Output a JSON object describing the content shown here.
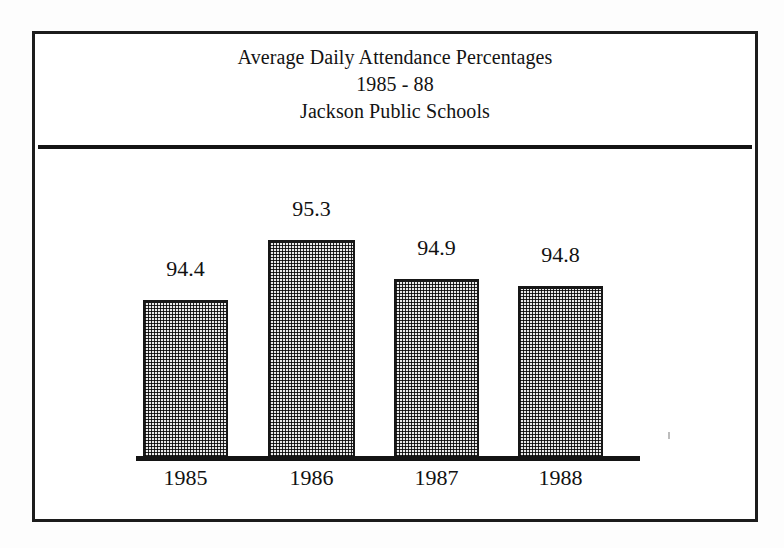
{
  "figure": {
    "title_lines": [
      "Average Daily Attendance Percentages",
      "1985 - 88",
      "Jackson Public Schools"
    ],
    "colors": {
      "ink": "#141414",
      "bar_fill": "#d8d8d8",
      "bar_outline": "#161616",
      "paper": "#ffffff"
    }
  },
  "chart_data": {
    "type": "bar",
    "title": "Average Daily Attendance Percentages 1985 - 88 Jackson Public Schools",
    "subtitle": "1985 - 88",
    "source_label": "Jackson Public Schools",
    "xlabel": "",
    "ylabel": "",
    "categories": [
      "1985",
      "1986",
      "1987",
      "1988"
    ],
    "values": [
      94.4,
      95.3,
      94.9,
      94.8
    ],
    "value_labels": [
      "94.4",
      "95.3",
      "94.9",
      "94.8"
    ],
    "ylim": [
      93.0,
      95.6
    ],
    "grid": false,
    "legend": false,
    "axis": {
      "y_axis_visible": false,
      "x_axis_visible": true,
      "tick_labels_visible": false
    },
    "bars": [
      {
        "category": "1985",
        "value": 94.4,
        "label": "94.4",
        "left": 143,
        "top": 300,
        "width": 85,
        "height": 158,
        "label_left": 143,
        "label_top": 258
      },
      {
        "category": "1986",
        "value": 95.3,
        "label": "95.3",
        "left": 268,
        "top": 240,
        "width": 87,
        "height": 218,
        "label_left": 268,
        "label_top": 198
      },
      {
        "category": "1987",
        "value": 94.9,
        "label": "94.9",
        "left": 394,
        "top": 279,
        "width": 85,
        "height": 179,
        "label_left": 394,
        "label_top": 237
      },
      {
        "category": "1988",
        "value": 94.8,
        "label": "94.8",
        "left": 518,
        "top": 286,
        "width": 85,
        "height": 172,
        "label_left": 518,
        "label_top": 244
      }
    ]
  }
}
